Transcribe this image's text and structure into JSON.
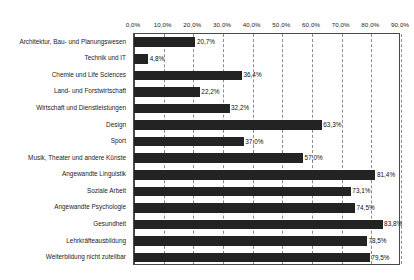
{
  "chart_data": {
    "type": "bar",
    "orientation": "horizontal",
    "title": "",
    "subtitle": "",
    "xlabel": "",
    "ylabel": "",
    "xlim": [
      0,
      90
    ],
    "xticks": [
      "0,0%",
      "10,0%",
      "20,0%",
      "30,0%",
      "40,0%",
      "50,0%",
      "60,0%",
      "70,0%",
      "80,0%",
      "90,0%"
    ],
    "xtick_values": [
      0,
      10,
      20,
      30,
      40,
      50,
      60,
      70,
      80,
      90
    ],
    "grid": "vertical-dashed",
    "legend": "none",
    "bar_color": "#232323",
    "categories": [
      "Architektur, Bau- und Planungswesen",
      "Technik und IT",
      "Chemie und Life Sciences",
      "Land- und Forstwirtschaft",
      "Wirtschaft und Dienstleistungen",
      "Design",
      "Sport",
      "Musik, Theater und andere Künste",
      "Angewandte Linguistik",
      "Soziale Arbeit",
      "Angewandte Psychologie",
      "Gesundheit",
      "Lehrkräfteausbildung",
      "Weiterbildung nicht zuteilbar"
    ],
    "values": [
      20.7,
      4.8,
      36.4,
      22.2,
      32.2,
      63.3,
      37.0,
      57.0,
      81.4,
      73.1,
      74.5,
      83.8,
      78.5,
      79.5
    ],
    "data_labels": [
      "20,7%",
      "4,8%",
      "36,4%",
      "22,2%",
      "32,2%",
      "63,3%",
      "37,0%",
      "57,0%",
      "81,4%",
      "73,1%",
      "74,5%",
      "83,8%",
      "78,5%",
      "79,5%"
    ]
  }
}
